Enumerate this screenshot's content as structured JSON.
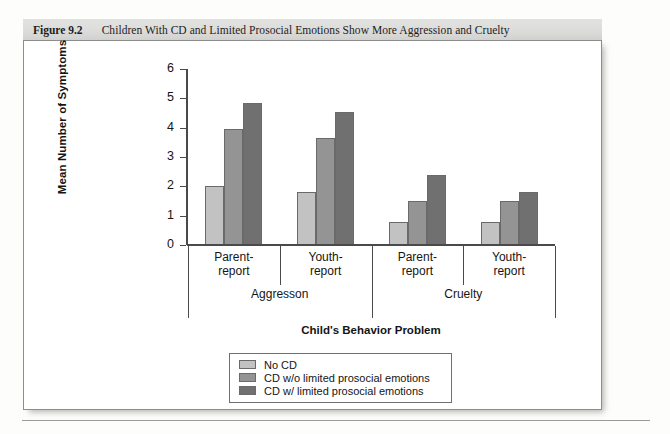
{
  "caption": {
    "number": "Figure 9.2",
    "text": "Children With CD and Limited Prosocial Emotions Show More Aggression and Cruelty"
  },
  "chart_data": {
    "type": "bar",
    "title": "Children With CD and Limited Prosocial Emotions Show More Aggression and Cruelty",
    "xlabel": "Child's Behavior Problem",
    "ylabel": "Mean Number of Symptoms",
    "ylim": [
      0,
      6
    ],
    "yticks": [
      "0",
      "1",
      "2",
      "3",
      "4",
      "5",
      "6"
    ],
    "grid": false,
    "legend_position": "bottom-center",
    "groups": [
      "Aggresson",
      "Cruelty"
    ],
    "categories": [
      "Parent-report",
      "Youth-report",
      "Parent-report",
      "Youth-report"
    ],
    "category_lines": [
      [
        "Parent-",
        "report"
      ],
      [
        "Youth-",
        "report"
      ],
      [
        "Parent-",
        "report"
      ],
      [
        "Youth-",
        "report"
      ]
    ],
    "series": [
      {
        "name": "No CD",
        "color": "#c2c2c2",
        "values": [
          2.0,
          1.8,
          0.8,
          0.8
        ]
      },
      {
        "name": "CD w/o limited prosocial emotions",
        "color": "#949494",
        "values": [
          3.95,
          3.65,
          1.5,
          1.5
        ]
      },
      {
        "name": "CD w/ limited prosocial emotions",
        "color": "#707070",
        "values": [
          4.85,
          4.55,
          2.4,
          1.8
        ]
      }
    ]
  }
}
